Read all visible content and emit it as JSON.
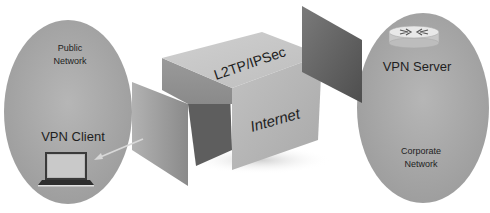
{
  "diagram": {
    "left_network": {
      "label_line1": "Public",
      "label_line2": "Network",
      "device_label": "VPN Client",
      "device_icon": "laptop-icon"
    },
    "right_network": {
      "label_line1": "Corporate",
      "label_line2": "Network",
      "device_label": "VPN Server",
      "device_icon": "router-icon"
    },
    "tunnel": {
      "protocol_label": "L2TP/IPSec",
      "medium_label": "Internet"
    },
    "colors": {
      "ellipse_fill": "#a9a9a9",
      "box_front": "#b4b4b4",
      "box_top": "#c6c6c6",
      "box_side_dark": "#5a5a5a",
      "panel_dark": "#6e6e6e",
      "text": "#1e1e1e"
    }
  }
}
